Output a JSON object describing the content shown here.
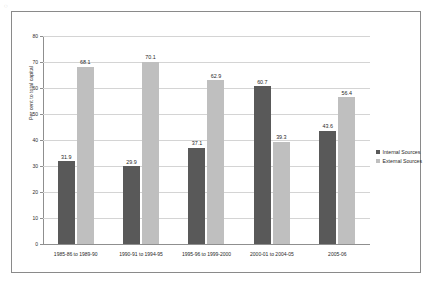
{
  "page": {
    "artifact_mark": "◌"
  },
  "chart_data": {
    "type": "bar",
    "title": "",
    "xlabel": "",
    "ylabel": "Per cent to total capital",
    "ylim": [
      0,
      80
    ],
    "yticks": [
      0,
      10,
      20,
      30,
      40,
      50,
      60,
      70,
      80
    ],
    "grid": true,
    "legend_position": "right",
    "categories": [
      "1985-86 to 1989-90",
      "1990-91 to 1994-95",
      "1995-96 to 1999-2000",
      "2000-01 to 2004-05",
      "2005-06"
    ],
    "series": [
      {
        "name": "Internal Sources",
        "color": "#595959",
        "values": [
          31.9,
          29.9,
          37.1,
          60.7,
          43.6
        ]
      },
      {
        "name": "External Sources",
        "color": "#bfbfbf",
        "values": [
          68.1,
          70.1,
          62.9,
          39.3,
          56.4
        ]
      }
    ]
  }
}
